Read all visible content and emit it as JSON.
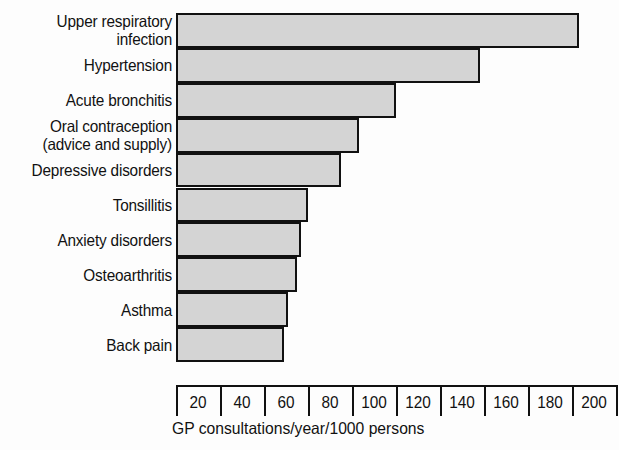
{
  "chart_data": {
    "type": "bar",
    "orientation": "horizontal",
    "title": "",
    "subtitle": "",
    "xlabel": "GP consultations/year/1000 persons",
    "ylabel": "",
    "xlim": [
      0,
      200
    ],
    "xticks": [
      0,
      20,
      40,
      60,
      80,
      100,
      120,
      140,
      160,
      180,
      200
    ],
    "xtick_labels": [
      "",
      "20",
      "40",
      "60",
      "80",
      "100",
      "120",
      "140",
      "160",
      "180",
      "200"
    ],
    "grid": false,
    "legend": null,
    "bar_fill_color": "#d4d4d4",
    "bar_edge_color": "#111111",
    "categories": [
      "Upper respiratory\ninfection",
      "Hypertension",
      "Acute bronchitis",
      "Oral contraception\n(advice and supply)",
      "Depressive disorders",
      "Tonsillitis",
      "Anxiety disorders",
      "Osteoarthritis",
      "Asthma",
      "Back pain"
    ],
    "values": [
      183,
      138,
      100,
      83,
      75,
      60,
      57,
      55,
      51,
      49
    ]
  }
}
